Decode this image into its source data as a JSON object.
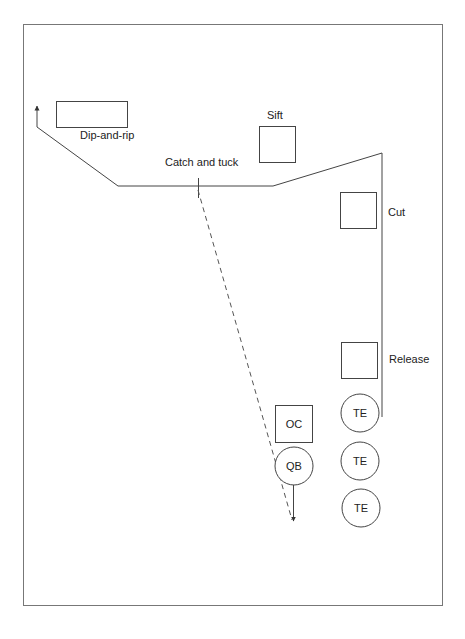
{
  "diagram": {
    "type": "football-play",
    "route_labels": {
      "dip_and_rip": "Dip-and-rip",
      "sift": "Sift",
      "catch_and_tuck": "Catch and tuck",
      "cut": "Cut",
      "release": "Release"
    },
    "players": {
      "oc": "OC",
      "qb": "QB",
      "te1": "TE",
      "te2": "TE",
      "te3": "TE"
    },
    "colors": {
      "stroke": "#444444",
      "border": "#777777",
      "text": "#222222"
    }
  }
}
